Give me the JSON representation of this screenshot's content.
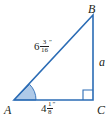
{
  "figure": {
    "kind": "right-triangle-geometry-diagram",
    "width": 112,
    "height": 124,
    "background_color": "#ffffff",
    "line_color": "#2b6cb5",
    "angle_fill_color": "#aec9e8",
    "text_color": "#231f20"
  },
  "vertices": {
    "a": {
      "label": "A",
      "x": 14,
      "y": 100
    },
    "b": {
      "label": "B",
      "x": 93,
      "y": 15
    },
    "c": {
      "label": "C",
      "x": 93,
      "y": 100
    }
  },
  "sides": {
    "hypotenuse": {
      "name": "AB",
      "whole": "6",
      "numerator": "3",
      "denominator": "16",
      "unit_mark": "″",
      "text": "6 3/16″"
    },
    "base": {
      "name": "AC",
      "whole": "4",
      "numerator": "1",
      "denominator": "8",
      "unit_mark": "″",
      "text": "4 1/8″"
    },
    "vertical_leg": {
      "name": "BC",
      "label": "a"
    }
  },
  "markers": {
    "right_angle": {
      "at_vertex": "C",
      "type": "square-marker"
    },
    "angle_arc": {
      "at_vertex": "A",
      "type": "shaded-arc"
    }
  }
}
